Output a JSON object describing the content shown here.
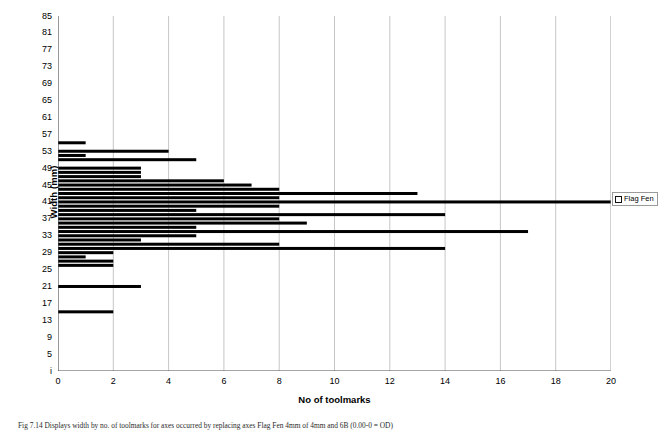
{
  "figure": {
    "caption": "Fig 7.14 Displays width by no. of toolmarks for axes occurred by replacing axes Flag Fen 4mm of 4mm and 6B (0.00-0 = OD)"
  },
  "legend": {
    "position": "right",
    "entries": [
      {
        "label": "Flag Fen",
        "swatch_icon": "square-swatch-icon",
        "color": "#000000"
      }
    ]
  },
  "chart_data": {
    "type": "bar",
    "orientation": "horizontal",
    "title": "",
    "subtitle": "",
    "xlabel": "No of toolmarks",
    "ylabel": "Width (mm)",
    "xlim": [
      0,
      20
    ],
    "ylim": [
      1,
      85
    ],
    "x_ticks": [
      0,
      2,
      4,
      6,
      8,
      10,
      12,
      14,
      16,
      18,
      20
    ],
    "x_tick_labels": [
      "0",
      "2",
      "4",
      "6",
      "8",
      "10",
      "12",
      "14",
      "16",
      "18",
      "20"
    ],
    "y_ticks": [
      1,
      3,
      5,
      7,
      9,
      11,
      13,
      15,
      17,
      19,
      21,
      23,
      25,
      27,
      29,
      31,
      33,
      35,
      37,
      39,
      41,
      43,
      45,
      47,
      49,
      51,
      53,
      55,
      57,
      59,
      61,
      63,
      65,
      67,
      69,
      71,
      73,
      75,
      77,
      79,
      81,
      83,
      85
    ],
    "y_tick_labels_shown": [
      "i",
      "5",
      "9",
      "13",
      "17",
      "21",
      "25",
      "29",
      "33",
      "37",
      "41",
      "45",
      "49",
      "53",
      "57",
      "61",
      "65",
      "69",
      "73",
      "77",
      "81",
      "85"
    ],
    "y_tick_label_values": [
      1,
      5,
      9,
      13,
      17,
      21,
      25,
      29,
      33,
      37,
      41,
      45,
      49,
      53,
      57,
      61,
      65,
      69,
      73,
      77,
      81,
      85
    ],
    "grid": {
      "vertical": true,
      "horizontal": false
    },
    "bar_color": "#000000",
    "series_name": "Flag Fen",
    "categories": [
      26,
      27,
      28,
      29,
      30,
      31,
      32,
      33,
      34,
      35,
      36,
      37,
      38,
      39,
      40,
      41,
      42,
      43,
      44,
      45,
      46,
      47,
      48,
      49,
      50,
      51,
      52,
      53,
      54,
      55
    ],
    "points": [
      {
        "width": 55,
        "count": 1
      },
      {
        "width": 53,
        "count": 4
      },
      {
        "width": 52,
        "count": 1
      },
      {
        "width": 51,
        "count": 5
      },
      {
        "width": 49,
        "count": 3
      },
      {
        "width": 48,
        "count": 3
      },
      {
        "width": 47,
        "count": 3
      },
      {
        "width": 46,
        "count": 6
      },
      {
        "width": 45,
        "count": 7
      },
      {
        "width": 44,
        "count": 8
      },
      {
        "width": 43,
        "count": 13
      },
      {
        "width": 42,
        "count": 8
      },
      {
        "width": 41,
        "count": 20
      },
      {
        "width": 40,
        "count": 8
      },
      {
        "width": 39,
        "count": 5
      },
      {
        "width": 38,
        "count": 14
      },
      {
        "width": 37,
        "count": 8
      },
      {
        "width": 36,
        "count": 9
      },
      {
        "width": 35,
        "count": 5
      },
      {
        "width": 34,
        "count": 17
      },
      {
        "width": 33,
        "count": 5
      },
      {
        "width": 32,
        "count": 3
      },
      {
        "width": 31,
        "count": 8
      },
      {
        "width": 30,
        "count": 14
      },
      {
        "width": 29,
        "count": 2
      },
      {
        "width": 28,
        "count": 1
      },
      {
        "width": 27,
        "count": 2
      },
      {
        "width": 26,
        "count": 2
      },
      {
        "width": 21,
        "count": 3
      },
      {
        "width": 15,
        "count": 2
      }
    ]
  }
}
